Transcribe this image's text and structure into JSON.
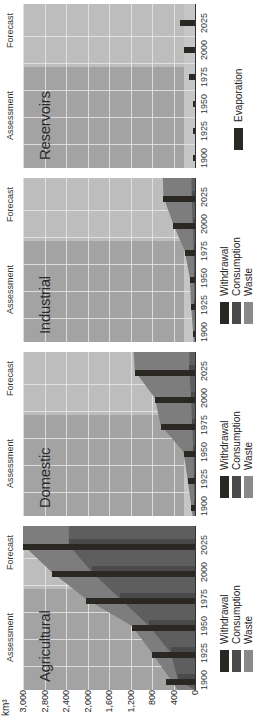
{
  "chart_data": {
    "type": "bar",
    "orientation_note": "figure is printed rotated 90 degrees counter-clockwise",
    "ylabel": "km³",
    "ylim": [
      0,
      3000
    ],
    "yticks": [
      "0",
      "400",
      "800",
      "1,200",
      "1,600",
      "2,000",
      "2,400",
      "2,800",
      "3,000"
    ],
    "categories": [
      "1900",
      "1925",
      "1950",
      "1975",
      "2000",
      "2025"
    ],
    "phase_labels": [
      "Assessment",
      "Forecast"
    ],
    "panels": [
      {
        "title": "Agricultural",
        "series": [
          {
            "name": "Withdrawal",
            "values": [
              500,
              750,
              1100,
              1900,
              2500,
              3000
            ]
          },
          {
            "name": "Consumption",
            "values": [
              300,
              420,
              800,
              1300,
              1800,
              2200
            ]
          },
          {
            "name": "Waste",
            "values": [
              200,
              330,
              300,
              600,
              700,
              800
            ]
          }
        ]
      },
      {
        "title": "Domestic",
        "series": [
          {
            "name": "Withdrawal",
            "values": [
              70,
              130,
              200,
              600,
              700,
              1050
            ]
          },
          {
            "name": "Consumption",
            "values": [
              10,
              20,
              30,
              50,
              70,
              100
            ]
          },
          {
            "name": "Waste",
            "values": [
              60,
              110,
              170,
              550,
              630,
              950
            ]
          }
        ]
      },
      {
        "title": "Industrial",
        "series": [
          {
            "name": "Withdrawal",
            "values": [
              35,
              70,
              90,
              180,
              380,
              550
            ]
          },
          {
            "name": "Consumption",
            "values": [
              5,
              10,
              15,
              25,
              40,
              60
            ]
          },
          {
            "name": "Waste",
            "values": [
              30,
              60,
              75,
              155,
              340,
              490
            ]
          }
        ]
      },
      {
        "title": "Reservoirs",
        "series": [
          {
            "name": "Evaporation",
            "values": [
              30,
              30,
              30,
              110,
              190,
              260
            ]
          }
        ]
      }
    ],
    "legend": {
      "main": [
        "Withdrawal",
        "Consumption",
        "Waste"
      ],
      "reservoirs": [
        "Evaporation"
      ]
    },
    "colors": {
      "withdrawal": "#2b2824",
      "consumption": "#4a4a4a",
      "waste": "#7d7d7d",
      "assessment_bg": "#a3a3a3",
      "forecast_bg": "#bdbdbd",
      "gridline": "#e6e6e6"
    }
  },
  "axis": {
    "unit": "km³",
    "ticks": [
      "0",
      "400",
      "800",
      "1,200",
      "1,600",
      "2,000",
      "2,400",
      "2,800",
      "3,000"
    ]
  },
  "panels": [
    {
      "title": "Agricultural",
      "assessment": "Assessment",
      "forecast": "Forecast"
    },
    {
      "title": "Domestic",
      "assessment": "Assessment",
      "forecast": "Forecast"
    },
    {
      "title": "Industrial",
      "assessment": "Assessment",
      "forecast": "Forecast"
    },
    {
      "title": "Reservoirs",
      "assessment": "Assessment",
      "forecast": "Forecast"
    }
  ],
  "years": [
    "1900",
    "1925",
    "1950",
    "1975",
    "2000",
    "2025"
  ],
  "legend": {
    "withdrawal": "Withdrawal",
    "consumption": "Consumption",
    "waste": "Waste",
    "evaporation": "Evaporation"
  }
}
